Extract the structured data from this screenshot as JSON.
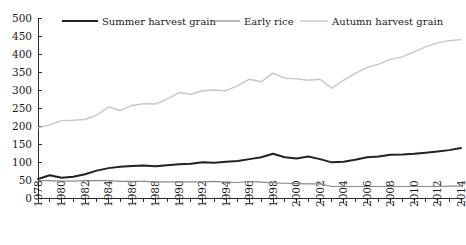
{
  "chart_data": {
    "type": "line",
    "title": "",
    "subtitle": "",
    "xlabel": "",
    "ylabel": "",
    "xlim": [
      1978,
      2014
    ],
    "ylim": [
      0,
      500
    ],
    "ytick_step": 50,
    "xtick_step": 1,
    "xtick_label_step": 2,
    "grid": false,
    "legend_position": "top",
    "yticks": [
      0,
      50,
      100,
      150,
      200,
      250,
      300,
      350,
      400,
      450,
      500
    ],
    "ytick_labels": [
      "0",
      "50",
      "100",
      "150",
      "200",
      "250",
      "300",
      "350",
      "400",
      "450",
      "500"
    ],
    "x": [
      1978,
      1979,
      1980,
      1981,
      1982,
      1983,
      1984,
      1985,
      1986,
      1987,
      1988,
      1989,
      1990,
      1991,
      1992,
      1993,
      1994,
      1995,
      1996,
      1997,
      1998,
      1999,
      2000,
      2001,
      2002,
      2003,
      2004,
      2005,
      2006,
      2007,
      2008,
      2009,
      2010,
      2011,
      2012,
      2013,
      2014
    ],
    "xtick_labels": [
      "1978",
      "1980",
      "1982",
      "1984",
      "1986",
      "1988",
      "1990",
      "1992",
      "1994",
      "1996",
      "1998",
      "2000",
      "2002",
      "2004",
      "2006",
      "2008",
      "2010",
      "2012",
      "2014"
    ],
    "series": [
      {
        "name": "Summer harvest grain",
        "color": "#222222",
        "width": 2.0,
        "values": [
          53,
          63,
          56,
          59,
          66,
          76,
          83,
          87,
          89,
          90,
          88,
          91,
          94,
          95,
          99,
          98,
          101,
          103,
          108,
          113,
          123,
          113,
          110,
          115,
          108,
          99,
          101,
          106,
          113,
          115,
          120,
          121,
          123,
          126,
          129,
          133,
          139
        ]
      },
      {
        "name": "Early rice",
        "color": "#8a8a8a",
        "width": 1.2,
        "values": [
          48,
          48,
          47,
          47,
          48,
          48,
          48,
          46,
          46,
          46,
          45,
          45,
          45,
          45,
          45,
          46,
          44,
          43,
          46,
          44,
          42,
          41,
          40,
          39,
          39,
          32,
          32,
          32,
          32,
          32,
          32,
          32,
          32,
          32,
          32,
          33,
          33
        ]
      },
      {
        "name": "Autumn harvest grain",
        "color": "#c6c6c6",
        "width": 1.4,
        "values": [
          195,
          203,
          215,
          216,
          218,
          230,
          253,
          243,
          257,
          262,
          261,
          275,
          293,
          288,
          298,
          300,
          298,
          312,
          330,
          323,
          347,
          333,
          331,
          327,
          330,
          305,
          327,
          346,
          362,
          372,
          385,
          392,
          406,
          420,
          431,
          437,
          440
        ]
      }
    ]
  },
  "legend": {
    "items": [
      {
        "label": "Summer harvest grain",
        "color": "#222222"
      },
      {
        "label": "Early rice",
        "color": "#8a8a8a"
      },
      {
        "label": "Autumn harvest grain",
        "color": "#c6c6c6"
      }
    ]
  }
}
